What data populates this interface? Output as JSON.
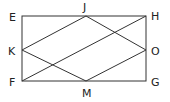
{
  "diagram": {
    "type": "geometry",
    "stroke_color": "#333333",
    "points": {
      "E": {
        "label": "E",
        "x": 22,
        "y": 16
      },
      "J": {
        "label": "J",
        "x": 86,
        "y": 16
      },
      "H": {
        "label": "H",
        "x": 146,
        "y": 16
      },
      "K": {
        "label": "K",
        "x": 22,
        "y": 50
      },
      "O": {
        "label": "O",
        "x": 146,
        "y": 50
      },
      "F": {
        "label": "F",
        "x": 22,
        "y": 81
      },
      "M": {
        "label": "M",
        "x": 86,
        "y": 81
      },
      "G": {
        "label": "G",
        "x": 146,
        "y": 81
      }
    },
    "segments": [
      [
        "E",
        "H"
      ],
      [
        "H",
        "G"
      ],
      [
        "G",
        "F"
      ],
      [
        "F",
        "E"
      ],
      [
        "K",
        "J"
      ],
      [
        "J",
        "O"
      ],
      [
        "O",
        "M"
      ],
      [
        "M",
        "K"
      ],
      [
        "F",
        "H"
      ]
    ],
    "labels": {
      "E": "E",
      "J": "J",
      "H": "H",
      "K": "K",
      "O": "O",
      "F": "F",
      "M": "M",
      "G": "G"
    }
  }
}
